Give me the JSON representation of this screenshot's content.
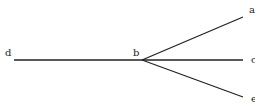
{
  "diagram": {
    "type": "tree",
    "nodes": [
      {
        "id": "d",
        "label": "d",
        "x": 14,
        "y": 60,
        "lx": 5,
        "ly": 48
      },
      {
        "id": "b",
        "label": "b",
        "x": 142,
        "y": 60,
        "lx": 133,
        "ly": 48
      },
      {
        "id": "a",
        "label": "a",
        "x": 243,
        "y": 17,
        "lx": 249,
        "ly": 5
      },
      {
        "id": "c",
        "label": "c",
        "x": 243,
        "y": 60,
        "lx": 251,
        "ly": 55
      },
      {
        "id": "e",
        "label": "e",
        "x": 243,
        "y": 97,
        "lx": 251,
        "ly": 94
      }
    ],
    "edges": [
      {
        "from": "d",
        "to": "b"
      },
      {
        "from": "b",
        "to": "a"
      },
      {
        "from": "b",
        "to": "c"
      },
      {
        "from": "b",
        "to": "e"
      }
    ],
    "line_color": "#222222"
  }
}
